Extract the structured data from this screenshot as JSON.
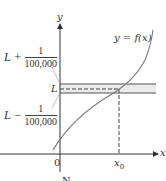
{
  "figure": {
    "axis_labels": {
      "x": "x",
      "y": "y"
    },
    "origin_label": "0",
    "curve_label": "y = f(x)",
    "L_label": "L",
    "upper_bound": {
      "prefix": "L +",
      "numerator": "1",
      "denominator": "100,000"
    },
    "lower_bound": {
      "prefix": "L −",
      "numerator": "1",
      "denominator": "100,000"
    },
    "x0_label": {
      "base": "x",
      "sub": "0"
    },
    "caption_partial": "N"
  },
  "colors": {
    "axis": "#333333",
    "curve": "#7a7a7a",
    "band": "#e6e6e6",
    "band_lines": "#555555",
    "dashed": "#555555"
  }
}
